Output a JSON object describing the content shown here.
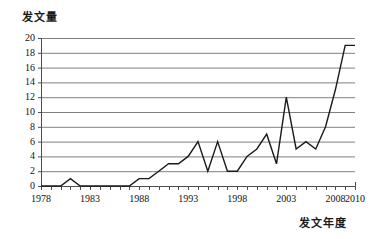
{
  "chart_data": {
    "type": "line",
    "title": "",
    "ylabel": "发文量",
    "xlabel": "发文年度",
    "grid": true,
    "legend": false,
    "xlim": [
      1978,
      2010
    ],
    "ylim": [
      0,
      20
    ],
    "ytick_step": 2,
    "yticks": [
      "20",
      "18",
      "16",
      "14",
      "12",
      "10",
      "8",
      "6",
      "4",
      "2",
      "0"
    ],
    "xticks": [
      "1978",
      "1983",
      "1988",
      "1993",
      "1998",
      "2003",
      "2008",
      "2010"
    ],
    "x": [
      1978,
      1979,
      1980,
      1981,
      1982,
      1983,
      1984,
      1985,
      1986,
      1987,
      1988,
      1989,
      1990,
      1991,
      1992,
      1993,
      1994,
      1995,
      1996,
      1997,
      1998,
      1999,
      2000,
      2001,
      2002,
      2003,
      2004,
      2005,
      2006,
      2007,
      2008,
      2009,
      2010
    ],
    "values": [
      0,
      0,
      0,
      1,
      0,
      0,
      0,
      0,
      0,
      0,
      1,
      1,
      2,
      3,
      3,
      4,
      6,
      2,
      6,
      2,
      2,
      4,
      5,
      7,
      3,
      12,
      5,
      6,
      5,
      8,
      13,
      19,
      19
    ],
    "series": [
      {
        "name": "发文量",
        "values": [
          0,
          0,
          0,
          1,
          0,
          0,
          0,
          0,
          0,
          0,
          1,
          1,
          2,
          3,
          3,
          4,
          6,
          2,
          6,
          2,
          2,
          4,
          5,
          7,
          3,
          12,
          5,
          6,
          5,
          8,
          13,
          19,
          19
        ]
      }
    ],
    "line_color": "#1a1a1a",
    "grid_color": "#808080",
    "axis_color": "#4d4d4d"
  }
}
